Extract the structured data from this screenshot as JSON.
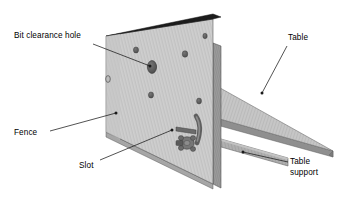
{
  "figure": {
    "background_color": "#ffffff",
    "line_color": "#1a1a1a"
  },
  "labels": [
    {
      "id": "bit-clearance-hole",
      "text": "Bit clearance hole",
      "x": 14,
      "y": 31,
      "leader": {
        "x1": 93,
        "y1": 44,
        "x2": 150,
        "y2": 66
      },
      "dot": {
        "x": 150,
        "y": 66
      }
    },
    {
      "id": "table",
      "text": "Table",
      "x": 288,
      "y": 33,
      "leader": {
        "x1": 287,
        "y1": 46,
        "x2": 262,
        "y2": 93
      },
      "dot": {
        "x": 262,
        "y": 93
      }
    },
    {
      "id": "fence",
      "text": "Fence",
      "x": 14,
      "y": 128,
      "leader": {
        "x1": 50,
        "y1": 131,
        "x2": 116,
        "y2": 113
      },
      "dot": {
        "x": 116,
        "y": 113
      }
    },
    {
      "id": "slot",
      "text": "Slot",
      "x": 79,
      "y": 161,
      "leader": {
        "x1": 100,
        "y1": 160,
        "x2": 172,
        "y2": 130
      },
      "dot": {
        "x": 172,
        "y": 130
      }
    },
    {
      "id": "table-support",
      "text": "Table\nsupport",
      "x": 290,
      "y": 157,
      "leader": {
        "x1": 288,
        "y1": 162,
        "x2": 243,
        "y2": 152
      },
      "dot": {
        "x": 243,
        "y": 152
      }
    }
  ],
  "parts": {
    "fence": {
      "name": "Fence",
      "face_color": "#cfcfcf",
      "top_edge_color": "#1c1c1c",
      "side_edge_color": "#9a9a9a"
    },
    "table": {
      "name": "Table",
      "top_color": "#c6c6c6",
      "edge_color": "#8f8f8f"
    },
    "table_support": {
      "name": "Table support",
      "color": "#a8a8a8",
      "edge_color": "#7d7d7d"
    },
    "bit_clearance_hole": {
      "name": "Bit clearance hole",
      "color": "#5a5a5a"
    },
    "slot": {
      "name": "Slot",
      "color": "#6b6b6b"
    },
    "clamp_handle": {
      "name": "Clamp lever handle",
      "color": "#6e6e6e"
    },
    "clamp_knob": {
      "name": "Star knob",
      "color": "#6a6a6a"
    },
    "mounting_holes": {
      "name": "Mounting holes",
      "count": 5,
      "color": "#4f4f4f"
    }
  }
}
